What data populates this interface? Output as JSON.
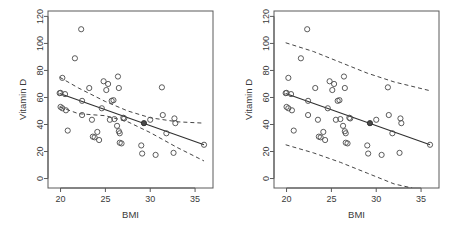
{
  "figure": {
    "panels": [
      {
        "name": "left-panel",
        "band_type": "confidence",
        "band_label": "95% confidence band"
      },
      {
        "name": "right-panel",
        "band_type": "prediction",
        "band_label": "95% prediction band"
      }
    ]
  },
  "axes": {
    "x": {
      "label": "BMI",
      "ticks": [
        20,
        25,
        30,
        35
      ],
      "tick_labels": [
        "20",
        "25",
        "30",
        "35"
      ],
      "min": 18.6,
      "max": 37.0
    },
    "y": {
      "label": "Vitamin D",
      "ticks": [
        0,
        20,
        40,
        60,
        80,
        100,
        120
      ],
      "tick_labels": [
        "0",
        "20",
        "40",
        "60",
        "80",
        "100",
        "120"
      ],
      "min": -7,
      "max": 124
    }
  },
  "colors": {
    "background": "#ffffff",
    "axis": "#5a5a5a",
    "text": "#3a3a3a",
    "line": "#303030",
    "point": "#4a4a4a"
  },
  "chart_data": {
    "type": "scatter",
    "title": "",
    "xlabel": "BMI",
    "ylabel": "Vitamin D",
    "xlim": [
      18.6,
      37.0
    ],
    "ylim": [
      -7,
      124
    ],
    "grid": false,
    "legend": "none",
    "panels": [
      "confidence band",
      "prediction band"
    ],
    "points": [
      {
        "x": 19.9,
        "y": 63.2,
        "filled": false
      },
      {
        "x": 20.0,
        "y": 63.4,
        "filled": false
      },
      {
        "x": 20.0,
        "y": 53.0,
        "filled": false
      },
      {
        "x": 20.2,
        "y": 52.0,
        "filled": false
      },
      {
        "x": 20.2,
        "y": 74.5,
        "filled": false
      },
      {
        "x": 20.5,
        "y": 62.5,
        "filled": false
      },
      {
        "x": 20.6,
        "y": 50.5,
        "filled": false
      },
      {
        "x": 20.8,
        "y": 35.5,
        "filled": false
      },
      {
        "x": 21.6,
        "y": 89.0,
        "filled": false
      },
      {
        "x": 22.3,
        "y": 110.5,
        "filled": false
      },
      {
        "x": 22.4,
        "y": 57.5,
        "filled": false
      },
      {
        "x": 22.4,
        "y": 47.0,
        "filled": false
      },
      {
        "x": 23.2,
        "y": 67.0,
        "filled": false
      },
      {
        "x": 23.5,
        "y": 43.5,
        "filled": false
      },
      {
        "x": 23.6,
        "y": 31.0,
        "filled": false
      },
      {
        "x": 23.8,
        "y": 30.5,
        "filled": false
      },
      {
        "x": 24.1,
        "y": 34.5,
        "filled": false
      },
      {
        "x": 24.3,
        "y": 28.5,
        "filled": false
      },
      {
        "x": 24.6,
        "y": 52.0,
        "filled": false
      },
      {
        "x": 24.8,
        "y": 72.0,
        "filled": false
      },
      {
        "x": 25.1,
        "y": 65.5,
        "filled": false
      },
      {
        "x": 25.3,
        "y": 70.0,
        "filled": false
      },
      {
        "x": 25.5,
        "y": 43.5,
        "filled": false
      },
      {
        "x": 25.7,
        "y": 57.5,
        "filled": false
      },
      {
        "x": 25.9,
        "y": 58.0,
        "filled": false
      },
      {
        "x": 26.0,
        "y": 44.0,
        "filled": false
      },
      {
        "x": 26.3,
        "y": 39.0,
        "filled": false
      },
      {
        "x": 26.4,
        "y": 75.5,
        "filled": false
      },
      {
        "x": 26.5,
        "y": 67.0,
        "filled": false
      },
      {
        "x": 26.5,
        "y": 35.0,
        "filled": false
      },
      {
        "x": 26.6,
        "y": 33.5,
        "filled": false
      },
      {
        "x": 26.6,
        "y": 26.5,
        "filled": false
      },
      {
        "x": 26.8,
        "y": 26.0,
        "filled": false
      },
      {
        "x": 27.0,
        "y": 45.0,
        "filled": false
      },
      {
        "x": 27.1,
        "y": 44.5,
        "filled": false
      },
      {
        "x": 29.0,
        "y": 24.5,
        "filled": false
      },
      {
        "x": 29.1,
        "y": 18.5,
        "filled": false
      },
      {
        "x": 29.3,
        "y": 41.0,
        "filled": true
      },
      {
        "x": 30.0,
        "y": 43.5,
        "filled": false
      },
      {
        "x": 30.6,
        "y": 17.5,
        "filled": false
      },
      {
        "x": 31.3,
        "y": 67.5,
        "filled": false
      },
      {
        "x": 31.4,
        "y": 47.0,
        "filled": false
      },
      {
        "x": 31.8,
        "y": 33.5,
        "filled": false
      },
      {
        "x": 32.6,
        "y": 19.0,
        "filled": false
      },
      {
        "x": 32.7,
        "y": 44.5,
        "filled": false
      },
      {
        "x": 32.8,
        "y": 41.0,
        "filled": false
      },
      {
        "x": 36.0,
        "y": 25.0,
        "filled": false
      }
    ],
    "regression_line": {
      "x_start": 19.9,
      "y_start": 63.0,
      "x_end": 36.0,
      "y_end": 25.0,
      "slope": -2.36,
      "intercept": 110.0
    },
    "confidence_band": {
      "upper": [
        [
          19.9,
          75.0
        ],
        [
          22.0,
          67.0
        ],
        [
          25.0,
          57.0
        ],
        [
          27.5,
          50.0
        ],
        [
          30.0,
          45.0
        ],
        [
          33.0,
          42.0
        ],
        [
          36.0,
          41.0
        ]
      ],
      "lower": [
        [
          19.9,
          53.0
        ],
        [
          22.0,
          48.0
        ],
        [
          25.0,
          46.5
        ],
        [
          27.5,
          42.0
        ],
        [
          30.0,
          34.0
        ],
        [
          33.0,
          23.0
        ],
        [
          36.0,
          13.0
        ]
      ]
    },
    "prediction_band": {
      "upper": [
        [
          19.9,
          100.5
        ],
        [
          23.0,
          94.0
        ],
        [
          26.0,
          86.0
        ],
        [
          29.0,
          78.0
        ],
        [
          32.0,
          71.5
        ],
        [
          36.0,
          65.0
        ]
      ],
      "lower": [
        [
          19.9,
          25.0
        ],
        [
          23.0,
          19.0
        ],
        [
          26.0,
          12.0
        ],
        [
          29.0,
          4.0
        ],
        [
          32.0,
          -4.0
        ],
        [
          34.0,
          -7.0
        ]
      ]
    }
  }
}
